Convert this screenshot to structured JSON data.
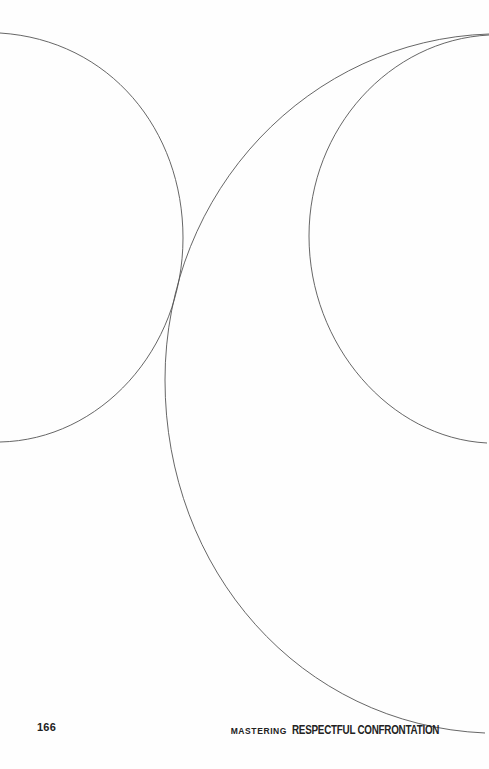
{
  "page": {
    "number": "166",
    "running_title_prefix": "MASTERING",
    "running_title_main": "RESPECTFUL CONFRONTATION"
  },
  "illustration": {
    "description": "Decorative line art of three intersecting circular arcs",
    "stroke_color": "#555555"
  }
}
